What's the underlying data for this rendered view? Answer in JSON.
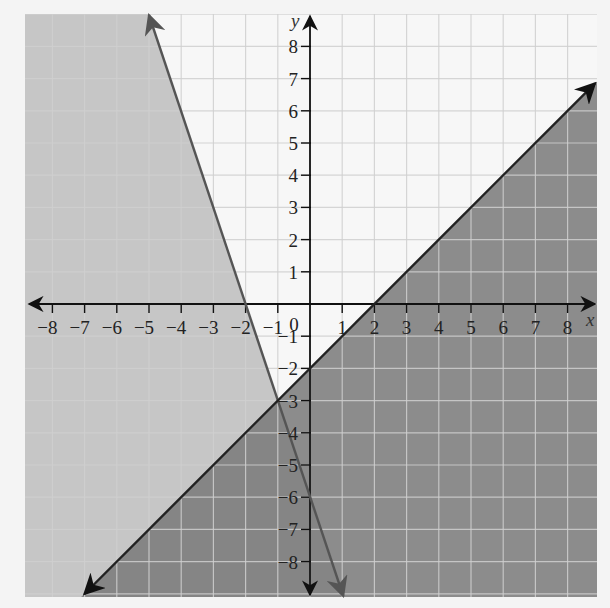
{
  "chart_data": {
    "type": "line",
    "title": "",
    "xlabel": "x",
    "ylabel": "y",
    "xlim": [
      -8.9,
      8.9
    ],
    "ylim": [
      -9.1,
      9.1
    ],
    "grid": true,
    "x_ticks": [
      -8,
      -7,
      -6,
      -5,
      -4,
      -3,
      -2,
      -1,
      1,
      2,
      3,
      4,
      5,
      6,
      7,
      8
    ],
    "y_ticks": [
      -8,
      -7,
      -6,
      -5,
      -4,
      -3,
      -2,
      -1,
      1,
      2,
      3,
      4,
      5,
      6,
      7,
      8
    ],
    "origin_label": "0",
    "series": [
      {
        "name": "y = -3x - 6",
        "slope": -3,
        "intercept": -6,
        "points": [
          [
            -4.8,
            8.9
          ],
          [
            -1,
            -3
          ],
          [
            1,
            -9
          ]
        ],
        "line_color": "#555555",
        "shade": "left (y ≤ -3x - 6)",
        "shade_color": "#c6c6c6"
      },
      {
        "name": "y = x - 2",
        "slope": 1,
        "intercept": -2,
        "points": [
          [
            -6.8,
            -8.8
          ],
          [
            2,
            0
          ],
          [
            9,
            7
          ]
        ],
        "line_color": "#222222",
        "shade": "below-right (y ≤ x - 2)",
        "shade_color": "#8c8c8c"
      }
    ],
    "intersection": [
      -1,
      -3
    ],
    "colors": {
      "background": "#f4f4f4",
      "unshaded": "#f7f7f7",
      "grid": "#c8c8c8",
      "light_shade": "#c6c6c6",
      "dark_shade": "#8c8c8c",
      "overlap_shade": "#858585",
      "axis": "#111111"
    }
  }
}
